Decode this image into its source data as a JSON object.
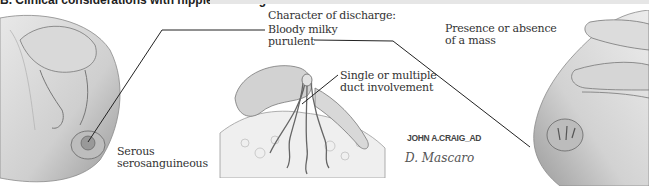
{
  "figure": {
    "section_title": "B. Clinical considerations with nipple discharge",
    "labels": {
      "serous": [
        "Serous",
        "serosanguineous"
      ],
      "character_heading": "Character of discharge:",
      "bloody_milky": "Bloody milky",
      "purulent": "purulent",
      "duct": [
        "Single or multiple",
        "duct involvement"
      ],
      "mass": [
        "Presence or absence",
        "of a mass"
      ]
    },
    "signatures": {
      "artist": "JOHN A.CRAIG_AD",
      "colorist": "D. Mascaro"
    },
    "panels": [
      {
        "name": "left",
        "description": "Hand expressing nipple discharge from breast"
      },
      {
        "name": "center",
        "description": "Fingers pinching nipple showing ducts"
      },
      {
        "name": "right",
        "description": "Hand palpating breast for a mass"
      }
    ]
  }
}
